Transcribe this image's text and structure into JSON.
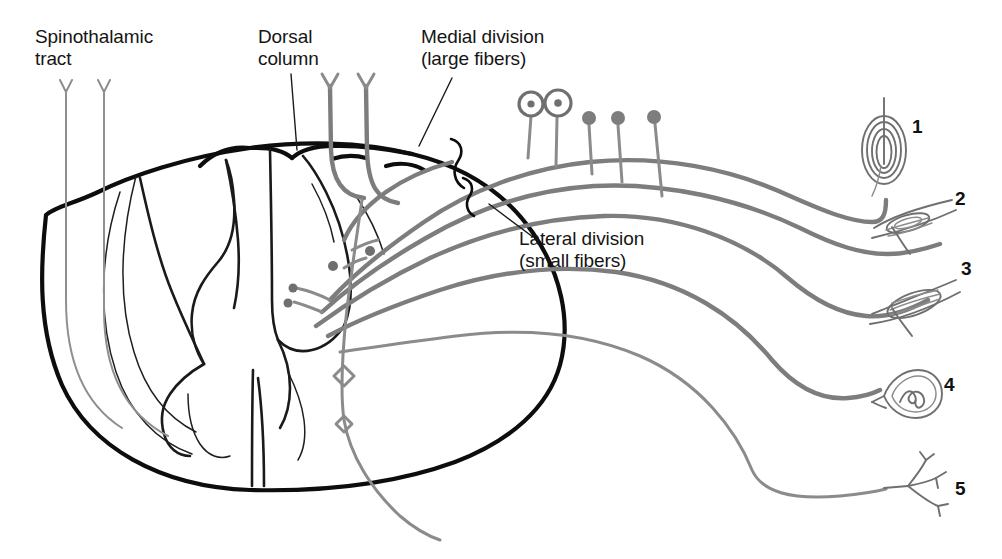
{
  "figure": {
    "width": 1002,
    "height": 559,
    "background": "#ffffff",
    "fiber_color": "#7d7d7d",
    "outline_color": "#0d0d0d",
    "text_color": "#151515"
  },
  "labels": {
    "spinothalamic": {
      "line1": "Spinothalamic",
      "line2": "tract"
    },
    "dorsal_column": {
      "line1": "Dorsal",
      "line2": "column"
    },
    "medial_division": {
      "line1": "Medial division",
      "line2": "(large fibers)"
    },
    "lateral_division": {
      "line1": "Lateral division",
      "line2": "(small fibers)"
    }
  },
  "receptors": [
    {
      "number": "1",
      "icon": "pacinian-corpuscle-icon",
      "name": "pacinian-corpuscle"
    },
    {
      "number": "2",
      "icon": "ruffini-ending-icon",
      "name": "ruffini-ending"
    },
    {
      "number": "3",
      "icon": "muscle-spindle-icon",
      "name": "muscle-spindle"
    },
    {
      "number": "4",
      "icon": "meissner-corpuscle-icon",
      "name": "meissner-corpuscle"
    },
    {
      "number": "5",
      "icon": "free-nerve-ending-icon",
      "name": "free-nerve-ending"
    }
  ],
  "ganglion": {
    "large_cell_count": 2,
    "small_cell_count": 3
  }
}
